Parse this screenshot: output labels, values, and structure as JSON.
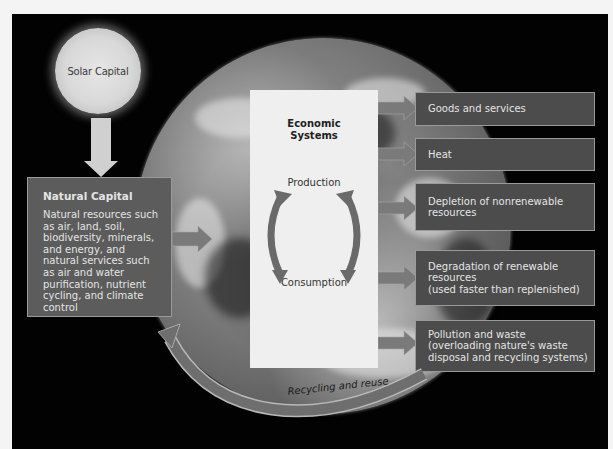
{
  "diagram": {
    "type": "flow-diagram",
    "background_color": "#020202",
    "box_color": "#4c4c4c",
    "arrow_color": "#7a7a7a",
    "solar": {
      "label": "Solar Capital"
    },
    "natural_capital": {
      "title": "Natural Capital",
      "body": "Natural resources such as air, land, soil, biodiversity, minerals, and energy, and natural services such as air and water purification, nutrient cycling, and climate control"
    },
    "economic_systems": {
      "title_line1": "Economic",
      "title_line2": "Systems",
      "production": "Production",
      "consumption": "Consumption"
    },
    "outputs": [
      {
        "label": "Goods and services"
      },
      {
        "label": "Heat"
      },
      {
        "label": "Depletion of nonrenewable resources"
      },
      {
        "label": "Degradation of renewable resources (used faster than replenished)"
      },
      {
        "label": "Pollution and waste (overloading  nature's waste disposal  and recycling systems)"
      }
    ],
    "outputs_lines": [
      [
        "Goods and services"
      ],
      [
        "Heat"
      ],
      [
        "Depletion of nonrenewable",
        "resources"
      ],
      [
        "Degradation of renewable",
        "resources",
        "(used faster than replenished)"
      ],
      [
        "Pollution and waste",
        "(overloading  nature's waste",
        "disposal  and recycling systems)"
      ]
    ],
    "recycling": {
      "label": "Recycling and reuse"
    }
  }
}
